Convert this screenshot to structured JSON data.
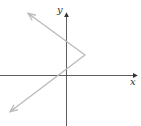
{
  "diagram": {
    "type": "coordinate-graph",
    "axes": {
      "x_label": "x",
      "y_label": "y"
    },
    "curve": {
      "description": "V-shaped graph opening left with vertex in the first quadrant",
      "vertex": [
        85,
        55
      ],
      "upper_arrow_end": [
        29,
        14
      ],
      "lower_arrow_end": [
        11,
        111
      ],
      "color": "#bbbbbb"
    },
    "axis_color": "#333333"
  }
}
